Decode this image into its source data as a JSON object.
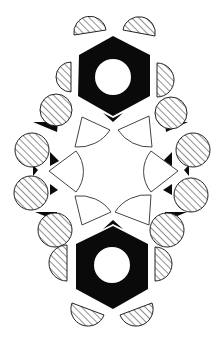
{
  "figure": {
    "title": "",
    "colors": {
      "background": "#ffffff",
      "fill": "#0a0a0a",
      "outline": "#333333"
    },
    "hexagons": [
      {
        "name": "top-hexagon",
        "points": "113,36 150,55 150,96 113,116 78,96 79,55",
        "hole": {
          "cx": 113,
          "cy": 77,
          "r": 18
        }
      },
      {
        "name": "bottom-hexagon",
        "points": "113,226 148,244 148,289 113,309 76,289 76,244",
        "hole": {
          "cx": 112,
          "cy": 265,
          "r": 18
        }
      }
    ],
    "hatched_circles": [
      {
        "cx": 56,
        "cy": 110,
        "r": 16
      },
      {
        "cx": 32,
        "cy": 150,
        "r": 17
      },
      {
        "cx": 171,
        "cy": 113,
        "r": 16
      },
      {
        "cx": 193,
        "cy": 150,
        "r": 17
      },
      {
        "cx": 31,
        "cy": 193,
        "r": 17
      },
      {
        "cx": 55,
        "cy": 230,
        "r": 17
      },
      {
        "cx": 191,
        "cy": 195,
        "r": 17
      },
      {
        "cx": 167,
        "cy": 230,
        "r": 17
      }
    ],
    "hatched_semicircles": [
      {
        "d": "M74,35 A16,16 0 0 1 106,30 Z"
      },
      {
        "d": "M123,30 A16,16 0 0 1 155,36 Z"
      },
      {
        "d": "M71,62 A15,15 0 0 0 71,92 Z"
      },
      {
        "d": "M157,63 A16,16 0 0 1 157,97 Z"
      },
      {
        "d": "M67,245 A17,17 0 0 0 67,281 Z"
      },
      {
        "d": "M155,247 A17,17 0 0 1 155,281 Z"
      },
      {
        "d": "M72,303 A16,16 0 0 0 104,315 Z"
      },
      {
        "d": "M120,315 A16,16 0 0 0 152,303 Z"
      }
    ],
    "sectors": [
      {
        "d": "M82,117 L110,130 A38,38 0 0 1 75,147 Z"
      },
      {
        "d": "M149,116 L152,147 A38,38 0 0 1 118,130 Z"
      },
      {
        "d": "M49,171 L76,151 A32,32 0 0 1 76,192 Z"
      },
      {
        "d": "M178,171 L151,151 A32,32 0 0 0 151,192 Z"
      },
      {
        "d": "M75,196 A38,38 0 0 1 111,212 L82,225 Z"
      },
      {
        "d": "M151,195 L149,225 L115,212 A38,38 0 0 1 151,195 Z"
      }
    ],
    "wedges": [
      {
        "points": "33,122 58,122 57,132"
      },
      {
        "points": "50,152 59,161 50,166"
      },
      {
        "points": "33,165 38,170 33,176"
      },
      {
        "points": "50,184 58,190 50,195"
      },
      {
        "points": "35,212 57,212 57,221"
      },
      {
        "points": "188,122 165,122 166,132"
      },
      {
        "points": "172,152 163,161 172,166"
      },
      {
        "points": "189,165 184,170 189,176"
      },
      {
        "points": "172,184 163,190 172,195"
      },
      {
        "points": "187,212 165,212 165,221"
      },
      {
        "points": "103,113 113,118 123,113 113,122"
      },
      {
        "points": "103,229 113,224 123,229 113,220"
      }
    ]
  }
}
